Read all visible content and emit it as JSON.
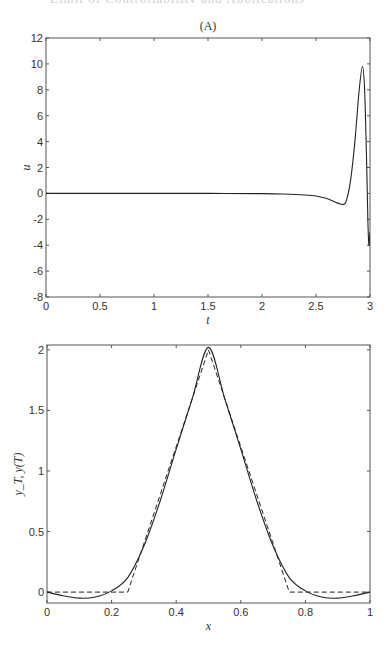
{
  "page": {
    "header_text": "Limit of Controllability and Applications"
  },
  "chart_data": [
    {
      "type": "line",
      "title": "(A)",
      "xlabel": "t",
      "ylabel": "u",
      "xlim": [
        0,
        3
      ],
      "ylim": [
        -8,
        12
      ],
      "xticks": [
        0,
        0.5,
        1,
        1.5,
        2,
        2.5,
        3
      ],
      "xtick_labels": [
        "0",
        "0.5",
        "1",
        "1.5",
        "2",
        "2.5",
        "3"
      ],
      "yticks": [
        -8,
        -6,
        -4,
        -2,
        0,
        2,
        4,
        6,
        8,
        10,
        12
      ],
      "ytick_labels": [
        "-8",
        "-6",
        "-4",
        "-2",
        "0",
        "2",
        "4",
        "6",
        "8",
        "10",
        "12"
      ],
      "grid": false,
      "series": [
        {
          "name": "u(t)",
          "style": "solid",
          "x": [
            0,
            0.5,
            1.0,
            1.5,
            2.0,
            2.2,
            2.4,
            2.5,
            2.6,
            2.7,
            2.75,
            2.78,
            2.82,
            2.86,
            2.9,
            2.93,
            2.95,
            2.97,
            2.98,
            2.99,
            3.0
          ],
          "y": [
            0,
            0,
            0,
            0,
            -0.02,
            -0.05,
            -0.12,
            -0.2,
            -0.4,
            -0.75,
            -0.85,
            -0.6,
            1.0,
            4.0,
            8.0,
            9.8,
            8.0,
            2.0,
            -2.0,
            -4.0,
            -3.0
          ]
        }
      ]
    },
    {
      "type": "line",
      "title": "",
      "xlabel": "x",
      "ylabel": "y_T, y(T)",
      "xlim": [
        0,
        1
      ],
      "ylim": [
        -0.09,
        2.04
      ],
      "xticks": [
        0,
        0.2,
        0.4,
        0.6,
        0.8,
        1
      ],
      "xtick_labels": [
        "0",
        "0.2",
        "0.4",
        "0.6",
        "0.8",
        "1"
      ],
      "yticks": [
        0,
        0.5,
        1,
        1.5,
        2
      ],
      "ytick_labels": [
        "0",
        "0.5",
        "1",
        "1.5",
        "2"
      ],
      "grid": false,
      "series": [
        {
          "name": "y(T)",
          "style": "solid",
          "x": [
            0,
            0.05,
            0.1,
            0.15,
            0.2,
            0.25,
            0.3,
            0.35,
            0.4,
            0.45,
            0.5,
            0.55,
            0.6,
            0.65,
            0.7,
            0.75,
            0.8,
            0.85,
            0.9,
            0.95,
            1.0
          ],
          "y": [
            0,
            -0.03,
            -0.05,
            -0.04,
            0.01,
            0.12,
            0.38,
            0.75,
            1.18,
            1.6,
            2.02,
            1.6,
            1.18,
            0.75,
            0.38,
            0.12,
            0.01,
            -0.04,
            -0.05,
            -0.03,
            0
          ]
        },
        {
          "name": "y_T",
          "style": "dashed",
          "x": [
            0,
            0.25,
            0.5,
            0.75,
            1.0
          ],
          "y": [
            0,
            0,
            2.0,
            0,
            0
          ]
        }
      ]
    }
  ]
}
